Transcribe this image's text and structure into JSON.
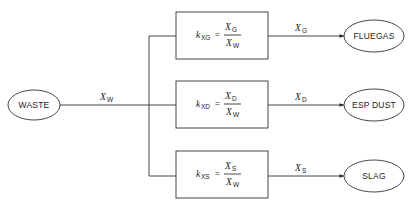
{
  "source": {
    "label": "WASTE",
    "flow_var": "X",
    "flow_sub": "W"
  },
  "branches": [
    {
      "coef_var": "k",
      "coef_sub": "XG",
      "num_var": "X",
      "num_sub": "G",
      "den_var": "X",
      "den_sub": "W",
      "out_var": "X",
      "out_sub": "G",
      "target": "FLUEGAS"
    },
    {
      "coef_var": "k",
      "coef_sub": "XD",
      "num_var": "X",
      "num_sub": "D",
      "den_var": "X",
      "den_sub": "W",
      "out_var": "X",
      "out_sub": "D",
      "target": "ESP DUST"
    },
    {
      "coef_var": "k",
      "coef_sub": "XS",
      "num_var": "X",
      "num_sub": "S",
      "den_var": "X",
      "den_sub": "W",
      "out_var": "X",
      "out_sub": "S",
      "target": "SLAG"
    }
  ],
  "equals_sign": "="
}
